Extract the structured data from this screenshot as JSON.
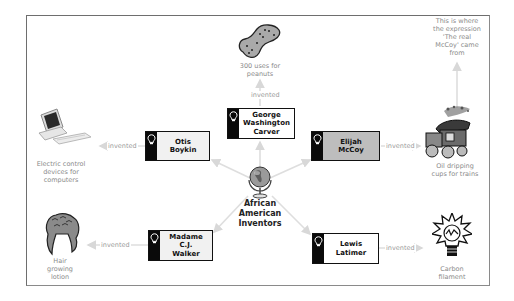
{
  "diagram": {
    "central_topic": {
      "label": "African\nAmerican\nInventors",
      "icon": "globe-icon"
    },
    "connector_label": "invented",
    "inventors": [
      {
        "name": "George\nWashington\nCarver",
        "invention": "300 uses for\npeanuts",
        "invention_icon": "peanut-icon",
        "style": "white"
      },
      {
        "name": "Otis\nBoykin",
        "invention": "Electric control\ndevices for\ncomputers",
        "invention_icon": "computer-icon",
        "style": "light"
      },
      {
        "name": "Elijah\nMcCoy",
        "invention": "Oil dripping\ncups for trains",
        "invention_icon": "train-icon",
        "style": "shaded",
        "note": "This is where\nthe expression\n'The real\nMcCoy' came\nfrom"
      },
      {
        "name": "Madame C.J.\nWalker",
        "invention": "Hair\ngrowing\nlotion",
        "invention_icon": "hair-icon",
        "style": "light"
      },
      {
        "name": "Lewis\nLatimer",
        "invention": "Carbon\nfilament",
        "invention_icon": "lightbulb-filament-icon",
        "style": "white"
      }
    ],
    "colors": {
      "border": "#111111",
      "stripe": "#0a0a0a",
      "shaded_fill": "#bdbdbd",
      "light_fill": "#f1f1f1",
      "connector": "#d6d6d6",
      "label_text": "#8a8a8a"
    }
  }
}
